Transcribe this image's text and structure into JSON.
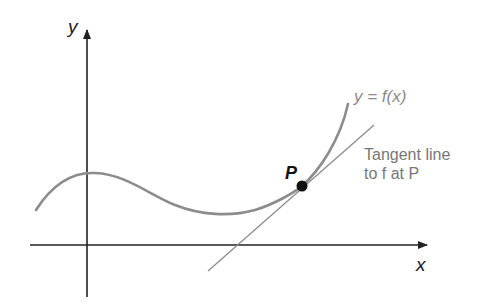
{
  "diagram": {
    "axes": {
      "x_label": "x",
      "y_label": "y"
    },
    "curve": {
      "label": "y = f(x)",
      "color": "#8c8c8c"
    },
    "point": {
      "label": "P",
      "color": "#111111"
    },
    "tangent": {
      "label_line1": "Tangent line",
      "label_line2": "to f at P",
      "color": "#8c8c8c"
    },
    "axis_color": "#222222"
  }
}
